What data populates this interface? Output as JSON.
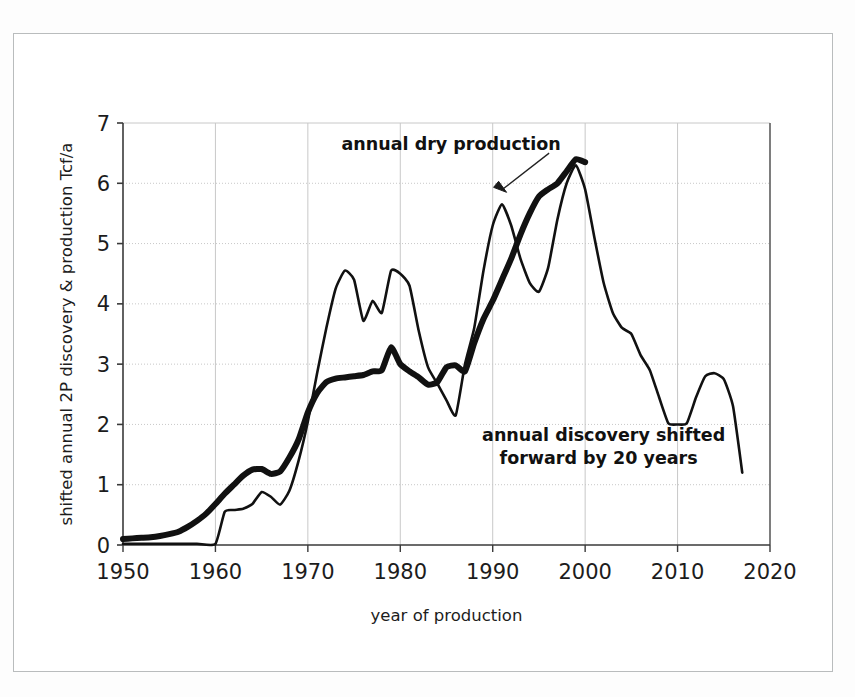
{
  "figure": {
    "background_color": "#ffffff",
    "frame_color": "#b9bcbd",
    "axis_color": "#3a3a3a",
    "grid_color": "#c8c8c8",
    "line_color": "#111111"
  },
  "chart_data": {
    "type": "line",
    "title": "",
    "xlabel": "year of production",
    "ylabel": "shifted annual 2P discovery & production Tcf/a",
    "xlim": [
      1950,
      2020
    ],
    "ylim": [
      0,
      7
    ],
    "xticks": [
      "1950",
      "1960",
      "1970",
      "1980",
      "1990",
      "2000",
      "2010",
      "2020"
    ],
    "yticks": [
      "0",
      "1",
      "2",
      "3",
      "4",
      "5",
      "6",
      "7"
    ],
    "grid": true,
    "legend_position": "inline-annotations",
    "annotations": [
      {
        "name": "annual-dry-production",
        "text": "annual dry production",
        "x": 1985.5,
        "y": 6.55,
        "arrow_to_x": 1991.5,
        "arrow_to_y": 5.85
      },
      {
        "name": "annual-discovery-shifted",
        "text_line_1": "annual discovery shifted",
        "text_line_2": "forward by 20 years",
        "x": 2002.0,
        "y": 1.72
      }
    ],
    "series": [
      {
        "name": "annual dry production",
        "style": "thick",
        "stroke_width": 6,
        "x": [
          1950,
          1951,
          1952,
          1953,
          1954,
          1955,
          1956,
          1957,
          1958,
          1959,
          1960,
          1961,
          1962,
          1963,
          1964,
          1965,
          1966,
          1967,
          1968,
          1969,
          1970,
          1971,
          1972,
          1973,
          1974,
          1975,
          1976,
          1977,
          1978,
          1979,
          1980,
          1981,
          1982,
          1983,
          1984,
          1985,
          1986,
          1987,
          1988,
          1989,
          1990,
          1991,
          1992,
          1993,
          1994,
          1995,
          1996,
          1997,
          1998,
          1999,
          2000
        ],
        "y": [
          0.1,
          0.11,
          0.12,
          0.13,
          0.15,
          0.18,
          0.22,
          0.3,
          0.4,
          0.52,
          0.68,
          0.85,
          1.0,
          1.15,
          1.25,
          1.26,
          1.18,
          1.22,
          1.45,
          1.75,
          2.2,
          2.52,
          2.7,
          2.76,
          2.78,
          2.8,
          2.82,
          2.88,
          2.9,
          3.28,
          3.0,
          2.88,
          2.78,
          2.66,
          2.7,
          2.95,
          2.98,
          2.88,
          3.35,
          3.75,
          4.05,
          4.4,
          4.75,
          5.15,
          5.5,
          5.78,
          5.9,
          6.0,
          6.2,
          6.4,
          6.35
        ]
      },
      {
        "name": "annual discovery shifted forward by 20 years",
        "style": "thin",
        "stroke_width": 2.6,
        "x": [
          1950,
          1955,
          1958,
          1960,
          1961,
          1962,
          1963,
          1964,
          1965,
          1966,
          1967,
          1968,
          1969,
          1970,
          1971,
          1972,
          1973,
          1974,
          1975,
          1976,
          1977,
          1978,
          1979,
          1980,
          1981,
          1982,
          1983,
          1984,
          1985,
          1986,
          1987,
          1988,
          1989,
          1990,
          1991,
          1992,
          1993,
          1994,
          1995,
          1996,
          1997,
          1998,
          1999,
          2000,
          2001,
          2002,
          2003,
          2004,
          2005,
          2006,
          2007,
          2008,
          2009,
          2010,
          2011,
          2012,
          2013,
          2014,
          2015,
          2016,
          2017
        ],
        "y": [
          0.02,
          0.02,
          0.02,
          0.02,
          0.55,
          0.58,
          0.6,
          0.68,
          0.88,
          0.8,
          0.67,
          0.9,
          1.4,
          2.05,
          2.85,
          3.6,
          4.25,
          4.55,
          4.4,
          3.72,
          4.05,
          3.85,
          4.55,
          4.5,
          4.3,
          3.55,
          2.95,
          2.68,
          2.4,
          2.15,
          3.0,
          3.6,
          4.55,
          5.3,
          5.65,
          5.3,
          4.75,
          4.35,
          4.2,
          4.6,
          5.4,
          6.0,
          6.3,
          5.9,
          5.1,
          4.35,
          3.85,
          3.6,
          3.5,
          3.15,
          2.9,
          2.45,
          2.02,
          2.0,
          2.02,
          2.45,
          2.8,
          2.85,
          2.75,
          2.3,
          1.2
        ]
      }
    ]
  }
}
